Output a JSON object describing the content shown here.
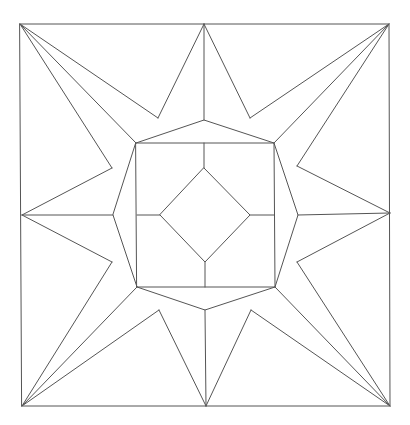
{
  "figure": {
    "stroke_color": "#555555",
    "background": "#ffffff",
    "outer_square": [
      [
        20,
        24
      ],
      [
        389,
        24
      ],
      [
        390,
        406
      ],
      [
        22,
        406
      ]
    ],
    "midpoints": {
      "top": [
        204,
        24
      ],
      "right": [
        390,
        213
      ],
      "bottom": [
        206,
        406
      ],
      "left": [
        22,
        215
      ]
    },
    "octagon": [
      [
        136,
        143
      ],
      [
        204,
        120
      ],
      [
        274,
        143
      ],
      [
        298,
        215
      ],
      [
        275,
        287
      ],
      [
        205,
        310
      ],
      [
        137,
        287
      ],
      [
        113,
        215
      ]
    ],
    "inner_square": [
      [
        136,
        143
      ],
      [
        274,
        143
      ],
      [
        275,
        287
      ],
      [
        137,
        287
      ]
    ],
    "diamond": [
      [
        204,
        168
      ],
      [
        250,
        215
      ],
      [
        205,
        262
      ],
      [
        160,
        215
      ]
    ],
    "star_valleys": [
      [
        158,
        118
      ],
      [
        250,
        118
      ],
      [
        297,
        166
      ],
      [
        297,
        262
      ],
      [
        251,
        310
      ],
      [
        159,
        310
      ],
      [
        112,
        262
      ],
      [
        112,
        168
      ]
    ]
  }
}
